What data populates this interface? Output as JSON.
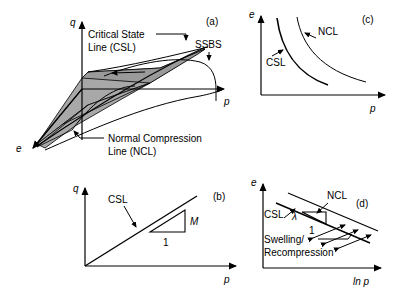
{
  "figure": {
    "background": "#ffffff",
    "line_color": "#000000",
    "shade_color": "#a8a8a8",
    "panels": [
      "(a)",
      "(b)",
      "(c)",
      "(d)"
    ]
  },
  "panel_a": {
    "tag": "(a)",
    "axis_q": "q",
    "axis_p": "p",
    "axis_e": "e",
    "label_csl_line1": "Critical State",
    "label_csl_line2": "Line (CSL)",
    "label_ssbs": "SSBS",
    "label_ncl_line1": "Normal Compression",
    "label_ncl_line2": "Line (NCL)"
  },
  "panel_b": {
    "tag": "(b)",
    "axis_q": "q",
    "axis_p": "p",
    "label_csl": "CSL",
    "label_slope_rise": "M",
    "label_slope_run": "1"
  },
  "panel_c": {
    "tag": "(c)",
    "axis_e": "e",
    "axis_p": "p",
    "label_csl": "CSL",
    "label_ncl": "NCL"
  },
  "panel_d": {
    "tag": "(d)",
    "axis_e": "e",
    "axis_lnp": "ln p",
    "label_csl": "CSL",
    "label_ncl": "NCL",
    "label_lambda": "λ",
    "label_slope_run": "1",
    "label_swelling_line1": "Swelling/",
    "label_swelling_line2": "Recompression"
  }
}
